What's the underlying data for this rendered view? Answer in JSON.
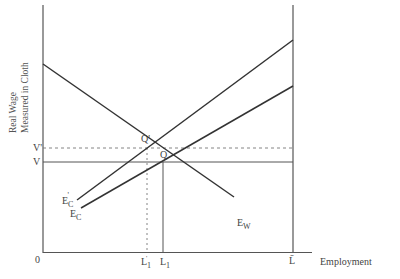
{
  "diagram": {
    "y_axis_label_line1": "Real Wage",
    "y_axis_label_line2": "Measured in Cloth",
    "x_axis_label": "Employment",
    "origin": "0",
    "wage_levels": {
      "v_prime": "V'",
      "v": "V"
    },
    "points": {
      "q_prime": "Q'",
      "q": "Q"
    },
    "employment_levels": {
      "l1_prime_main": "L",
      "l1_prime_sub": "1",
      "l1_prime_mark": "'",
      "l1_main": "L",
      "l1_sub": "1",
      "lbar": "L̄"
    },
    "curves": {
      "ew": {
        "main": "E",
        "sub": "W"
      },
      "ec_prime": {
        "main": "E",
        "sub": "C",
        "mark": "'"
      },
      "ec": {
        "main": "E",
        "sub": "C"
      }
    },
    "colors": {
      "line": "#333333",
      "axis": "#555555",
      "dashed": "#777777"
    }
  }
}
